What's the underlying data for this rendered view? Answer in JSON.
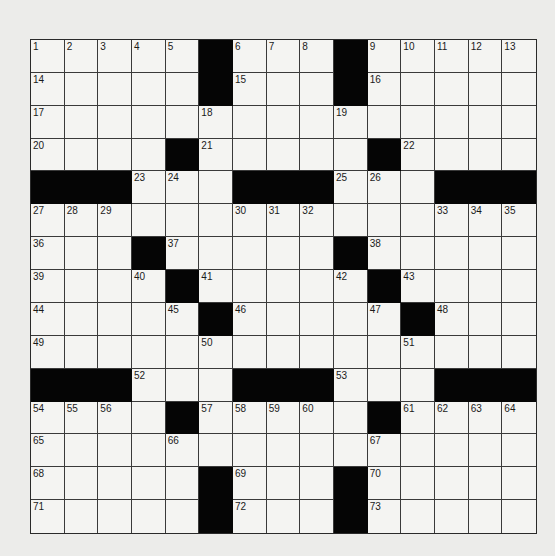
{
  "puzzle": {
    "rows": 15,
    "cols": 15,
    "layout": [
      "11111#111#11111",
      "11111#111#11111",
      "111111111111111",
      "1111#11111#1111",
      "###111###111###",
      "111111111111111",
      "111#11111#11111",
      "1111#11111#1111",
      "11111#11111#111",
      "111111111111111",
      "###111###111###",
      "1111#11111#1111",
      "111111111111111",
      "11111#111#11111",
      "11111#111#11111"
    ],
    "numbers": {
      "0,0": "1",
      "0,1": "2",
      "0,2": "3",
      "0,3": "4",
      "0,4": "5",
      "0,6": "6",
      "0,7": "7",
      "0,8": "8",
      "0,10": "9",
      "0,11": "10",
      "0,12": "11",
      "0,13": "12",
      "0,14": "13",
      "1,0": "14",
      "1,6": "15",
      "1,10": "16",
      "2,0": "17",
      "2,5": "18",
      "2,9": "19",
      "3,0": "20",
      "3,5": "21",
      "3,11": "22",
      "4,3": "23",
      "4,4": "24",
      "4,9": "25",
      "4,10": "26",
      "5,0": "27",
      "5,1": "28",
      "5,2": "29",
      "5,6": "30",
      "5,7": "31",
      "5,8": "32",
      "5,12": "33",
      "5,13": "34",
      "5,14": "35",
      "6,0": "36",
      "6,4": "37",
      "6,10": "38",
      "7,0": "39",
      "7,3": "40",
      "7,5": "41",
      "7,9": "42",
      "7,11": "43",
      "8,0": "44",
      "8,4": "45",
      "8,6": "46",
      "8,10": "47",
      "8,12": "48",
      "9,0": "49",
      "9,5": "50",
      "9,11": "51",
      "10,3": "52",
      "10,9": "53",
      "11,0": "54",
      "11,1": "55",
      "11,2": "56",
      "11,5": "57",
      "11,6": "58",
      "11,7": "59",
      "11,8": "60",
      "11,11": "61",
      "11,12": "62",
      "11,13": "63",
      "11,14": "64",
      "12,0": "65",
      "12,4": "66",
      "12,10": "67",
      "13,0": "68",
      "13,6": "69",
      "13,10": "70",
      "14,0": "71",
      "14,6": "72",
      "14,10": "73"
    },
    "entries": {}
  },
  "colors": {
    "background": "#ececea",
    "cell_white": "#f4f4f2",
    "cell_black": "#050505",
    "grid_line": "#3a3a3a"
  }
}
